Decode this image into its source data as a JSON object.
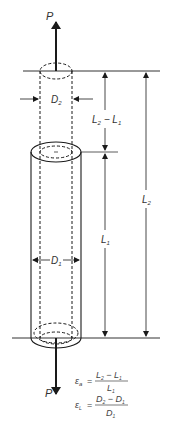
{
  "diagram": {
    "type": "tensile-specimen-strain",
    "colors": {
      "stroke": "#1a1a1a",
      "text": "#333333",
      "background": "#ffffff"
    },
    "labels": {
      "force_top": "P",
      "force_bottom": "P",
      "d2": {
        "main": "D",
        "sub": "2"
      },
      "d1": {
        "main": "D",
        "sub": "1"
      },
      "l2_minus_l1": {
        "a": "L",
        "a_sub": "2",
        "op": " − ",
        "b": "L",
        "b_sub": "1"
      },
      "l1": {
        "main": "L",
        "sub": "1"
      },
      "l2": {
        "main": "L",
        "sub": "2"
      }
    },
    "equations": [
      {
        "lhs": "ε",
        "lhs_sub": "a",
        "eq": "=",
        "num": {
          "a": "L",
          "a_sub": "2",
          "op": " − ",
          "b": "L",
          "b_sub": "1"
        },
        "den": {
          "main": "L",
          "sub": "1"
        }
      },
      {
        "lhs": "ε",
        "lhs_sub": "L",
        "eq": "=",
        "num": {
          "a": "D",
          "a_sub": "2",
          "op": " − ",
          "b": "D",
          "b_sub": "1"
        },
        "den": {
          "main": "D",
          "sub": "1"
        }
      }
    ]
  }
}
